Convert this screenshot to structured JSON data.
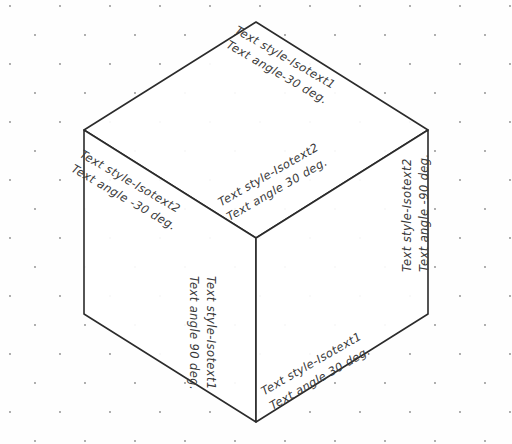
{
  "drawing": {
    "title": "Isometric cube with rotated text styles",
    "background": {
      "grid": "isometric-dot-grid",
      "dot_color": "#8a8a8a",
      "page_color": "#ffffff"
    },
    "cube": {
      "line_color": "#2b2b2b",
      "face_fill": "#ffffff",
      "faces": [
        "top",
        "left",
        "right"
      ]
    }
  },
  "labels": {
    "top_face_upper": {
      "style_line": "Text style-Isotext1",
      "angle_line": "Text angle-30 deg."
    },
    "top_face_lower": {
      "style_line": "Text style-Isotext2",
      "angle_line": "Text angle 30 deg."
    },
    "left_face": {
      "style_line": "Text style-Isotext2",
      "angle_line": "Text angle -30 deg."
    },
    "right_face": {
      "style_line": "Text style-Isotext2",
      "angle_line": "Text angle -90 deg."
    },
    "left_face_vertical": {
      "style_line": "Text style-Isotext1",
      "angle_line": "Text angle 90 deg."
    },
    "right_face_diagonal": {
      "style_line": "Text style-Isotext1",
      "angle_line": "Text angle 30 deg."
    }
  }
}
